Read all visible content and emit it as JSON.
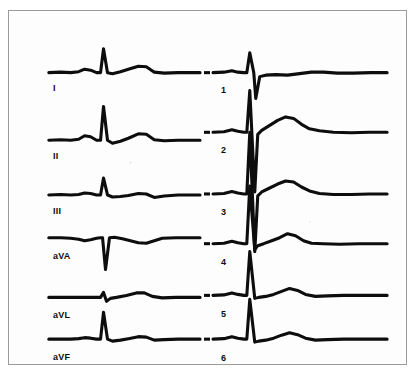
{
  "document": {
    "kind": "ecg-strip",
    "paper_color": "#fdfdfd",
    "trace_color": "#0d0d0d",
    "border_color": "#9a9a9a"
  },
  "chart_data": {
    "type": "line",
    "title": "",
    "subtitle": "",
    "xlabel": "",
    "ylabel": "",
    "grid": false,
    "legend_position": "inline-left",
    "axis_note": "Time on horizontal axis, voltage on vertical axis; no calibration grid printed.",
    "columns": [
      {
        "name": "limb-leads",
        "x_start": 40,
        "x_end": 192,
        "leads": [
          {
            "label": "I",
            "baseline_y": 62,
            "label_x": 44,
            "label_y": 72,
            "p_amplitude": 3,
            "r_amplitude": 24,
            "s_amplitude": 3,
            "t_amplitude": 7,
            "points": "40,62 52,61.5 62,62 70,61 76,58.5 82,59.5 88,62 92,62 95,38 99,62 104,63 112,61 120,58.5 130,55.5 138,56 146,61.5 156,62.5 170,62 192,62"
          },
          {
            "label": "II",
            "baseline_y": 130,
            "label_x": 44,
            "label_y": 140,
            "p_amplitude": 4,
            "r_amplitude": 34,
            "s_amplitude": 4,
            "t_amplitude": 8,
            "points": "40,130 52,129.5 62,130 70,129 76,125.5 82,126.5 88,130 92,130 95,96 99,130 104,133 112,131 120,128 130,123.5 138,124 146,129.5 156,130.5 170,130 192,130"
          },
          {
            "label": "III",
            "baseline_y": 185,
            "label_x": 44,
            "label_y": 195,
            "p_amplitude": 2,
            "r_amplitude": 17,
            "s_amplitude": 2,
            "t_amplitude": 3,
            "points": "40,185 52,184.5 62,185 70,184.5 76,183 82,183.5 88,185 92,185 95,168 99,185 104,187 112,186.5 120,185.5 130,183.5 138,184 146,187.5 156,186 170,185 192,185"
          },
          {
            "label": "aVA",
            "baseline_y": 228,
            "label_x": 44,
            "label_y": 240,
            "p_amplitude": -2,
            "r_amplitude": -32,
            "s_amplitude": 0,
            "t_amplitude": -5,
            "points": "40,228 52,228 62,228.5 70,229.5 76,231 82,230 88,228.5 92,228 94,228 97,260 101,228 106,227.5 114,229 122,231 130,233 138,233.5 146,231 154,228.5 168,228 192,228"
          },
          {
            "label": "aVL",
            "baseline_y": 288,
            "label_x": 44,
            "label_y": 299,
            "p_amplitude": 1,
            "r_amplitude": 5,
            "s_amplitude": 5,
            "t_amplitude": 5,
            "points": "40,288 52,288 62,288 70,288 78,288 86,288 92,288 95,283 98,292 102,289 108,288 118,286 128,283.5 136,283.5 144,287 154,288.5 168,288 192,288"
          },
          {
            "label": "aVF",
            "baseline_y": 330,
            "label_x": 44,
            "label_y": 341,
            "p_amplitude": 2,
            "r_amplitude": 27,
            "s_amplitude": 2,
            "t_amplitude": 3,
            "points": "40,330 52,330 62,330 70,329.5 76,328.5 82,329 88,330 92,330 95,303 99,330 104,332 112,331 120,329.5 130,327.5 138,328 146,331 156,330.5 170,330 192,330"
          }
        ]
      },
      {
        "name": "precordial-leads",
        "x_start": 205,
        "x_end": 380,
        "leads": [
          {
            "label": "1",
            "baseline_y": 62,
            "label_x": 212,
            "label_y": 74,
            "p_amplitude": 2,
            "r_amplitude": 20,
            "s_amplitude": -26,
            "t_amplitude": 2,
            "points": "205,62 216,61.5 224,60 230,61.5 236,62 239,62 242,42 246,62 248,88 252,66 258,64.5 268,64 280,64.5 292,63 304,61.5 316,61.5 330,62.5 346,62.5 364,62 380,62"
          },
          {
            "label": "2",
            "baseline_y": 122,
            "label_x": 212,
            "label_y": 134,
            "p_amplitude": 3,
            "r_amplitude": 42,
            "s_amplitude": -60,
            "t_amplitude": 14,
            "points": "205,122 216,121.5 224,119.5 230,121 236,122 239,122 242,80 247,182 250,124 254,120 262,115 270,110 278,106.5 286,108 294,114 302,118.5 312,120.5 326,122 344,122.5 362,122 380,122"
          },
          {
            "label": "3",
            "baseline_y": 184,
            "label_x": 212,
            "label_y": 196,
            "p_amplitude": 3,
            "r_amplitude": 62,
            "s_amplitude": -58,
            "t_amplitude": 12,
            "points": "205,184 216,183.5 224,181.5 230,183 236,184 239,184 242,122 247,242 250,186 254,182 262,178 270,174 278,171 286,172 294,177 302,181 312,183.5 326,184.5 344,184.5 362,184 380,184"
          },
          {
            "label": "4",
            "baseline_y": 234,
            "label_x": 212,
            "label_y": 246,
            "p_amplitude": 3,
            "r_amplitude": 58,
            "s_amplitude": -6,
            "t_amplitude": 11,
            "points": "205,234 216,233.5 224,231.5 230,233 236,234 239,234 242,176 247,240 250,236 256,234 264,231 272,228 280,224 288,226 296,231 304,233.5 316,234 332,234.5 352,234 380,234"
          },
          {
            "label": "5",
            "baseline_y": 286,
            "label_x": 212,
            "label_y": 298,
            "p_amplitude": 3,
            "r_amplitude": 44,
            "s_amplitude": -3,
            "t_amplitude": 8,
            "points": "205,286 216,285.5 224,283.5 230,285 236,286 239,286 242,242 247,289 251,288 258,287 266,285 274,282 282,279 290,281 298,285 308,287 320,286.5 336,286 356,286 380,286"
          },
          {
            "label": "6",
            "baseline_y": 330,
            "label_x": 212,
            "label_y": 342,
            "p_amplitude": 3,
            "r_amplitude": 40,
            "s_amplitude": -3,
            "t_amplitude": 7,
            "points": "205,330 216,329.5 224,327.5 230,329 236,330 239,330 242,290 247,333 251,332 258,331 266,329 274,326 282,323.5 290,325.5 298,329 308,331 320,330.5 336,330 356,330 380,330"
          }
        ]
      }
    ],
    "calibration_ticks": [
      {
        "lead": "1",
        "x": 202,
        "y": 62
      },
      {
        "lead": "2",
        "x": 202,
        "y": 122
      },
      {
        "lead": "3",
        "x": 202,
        "y": 184
      },
      {
        "lead": "4",
        "x": 202,
        "y": 234
      },
      {
        "lead": "5",
        "x": 202,
        "y": 286
      },
      {
        "lead": "6",
        "x": 202,
        "y": 330
      }
    ]
  }
}
